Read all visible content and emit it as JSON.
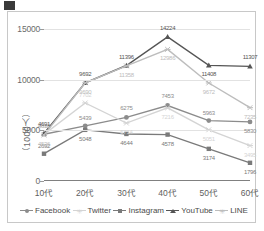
{
  "chart_data": {
    "type": "line",
    "title": "",
    "xlabel": "",
    "ylabel": "（1000人）",
    "categories": [
      "10代",
      "20代",
      "30代",
      "40代",
      "50代",
      "60代"
    ],
    "ylim": [
      0,
      15000
    ],
    "yticks": [
      0,
      5000,
      10000,
      15000
    ],
    "ytick_labels": [
      "0",
      "5000",
      "10000",
      "15000"
    ],
    "grid": true,
    "legend_position": "bottom",
    "series": [
      {
        "name": "Facebook",
        "color": "#8c8c8c",
        "marker": "circle",
        "values": [
          4618,
          5439,
          6275,
          7453,
          5963,
          5830
        ],
        "labels": [
          "4618",
          "5439",
          "6275",
          "7453",
          "5963",
          "5830"
        ]
      },
      {
        "name": "Twitter",
        "color": "#d4d4d4",
        "marker": "x",
        "values": [
          4598,
          7702,
          5714,
          7216,
          5051,
          3495
        ],
        "labels": [
          "4598",
          "7702",
          "5714",
          "7216",
          "5051",
          "3495"
        ]
      },
      {
        "name": "Instagram",
        "color": "#7a7a7a",
        "marker": "square",
        "values": [
          2692,
          5048,
          4644,
          4578,
          3174,
          1796
        ],
        "labels": [
          "2692",
          "5048",
          "4644",
          "4578",
          "3174",
          "1796"
        ]
      },
      {
        "name": "YouTube",
        "color": "#555555",
        "marker": "triangle",
        "values": [
          4691,
          9692,
          11396,
          14224,
          11408,
          11307
        ],
        "labels": [
          "4691",
          "9692",
          "11396",
          "14224",
          "11408",
          "11307"
        ]
      },
      {
        "name": "LINE",
        "color": "#bdbdbd",
        "marker": "x",
        "values": [
          4536,
          9690,
          11358,
          12986,
          9672,
          7235
        ],
        "labels": [
          "4536",
          "9690",
          "11358",
          "12986",
          "9672",
          "7235"
        ]
      }
    ]
  },
  "legend": {
    "items": [
      "Facebook",
      "Twitter",
      "Instagram",
      "YouTube",
      "LINE"
    ]
  }
}
